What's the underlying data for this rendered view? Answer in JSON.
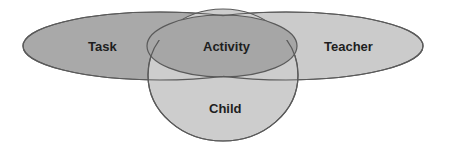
{
  "diagram": {
    "type": "venn",
    "sets": [
      {
        "id": "task",
        "label": "Task",
        "fill": "#a9a9a9"
      },
      {
        "id": "teacher",
        "label": "Teacher",
        "fill": "#cbcbcb"
      },
      {
        "id": "child",
        "label": "Child",
        "fill": "#cdcdcd"
      },
      {
        "id": "activity",
        "label": "Activity",
        "fill": "#a6a6a6"
      }
    ],
    "stroke_color": "#5a5a5a",
    "labels": {
      "task": "Task",
      "activity": "Activity",
      "teacher": "Teacher",
      "child": "Child"
    }
  }
}
